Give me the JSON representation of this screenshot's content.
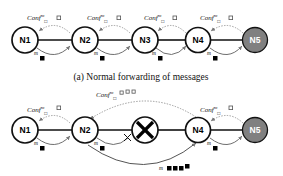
{
  "figure": {
    "panels": [
      {
        "id": "panel-a",
        "caption": "(a) Normal forwarding of messages",
        "node_cy": 40,
        "nodes": [
          {
            "label": "N1",
            "cx": 25,
            "filled": false
          },
          {
            "label": "N2",
            "cx": 85,
            "filled": false
          },
          {
            "label": "N3",
            "cx": 145,
            "filled": false
          },
          {
            "label": "N4",
            "cx": 198,
            "filled": false
          },
          {
            "label": "N5",
            "cx": 255,
            "filled": true
          }
        ],
        "conf_labels": [
          {
            "text": "Conf",
            "sup": "m",
            "sub": "□",
            "x": 40,
            "y": 18
          },
          {
            "text": "Conf",
            "sup": "m",
            "sub": "□",
            "x": 100,
            "y": 18
          },
          {
            "text": "Conf",
            "sup": "m",
            "sub": "□",
            "x": 156,
            "y": 18
          },
          {
            "text": "Conf",
            "sup": "m",
            "sub": "□",
            "x": 212,
            "y": 18
          }
        ],
        "msg_labels": [
          {
            "text": "m",
            "x": 37,
            "y": 53
          },
          {
            "text": "m",
            "x": 97,
            "y": 53
          },
          {
            "text": "m",
            "x": 155,
            "y": 53
          },
          {
            "text": "m",
            "x": 210,
            "y": 53
          }
        ]
      },
      {
        "id": "panel-b",
        "caption": "",
        "node_cy": 130,
        "nodes": [
          {
            "label": "N1",
            "cx": 25,
            "filled": false,
            "failed": false
          },
          {
            "label": "N2",
            "cx": 85,
            "filled": false,
            "failed": false
          },
          {
            "label": "",
            "cx": 145,
            "filled": false,
            "failed": true
          },
          {
            "label": "N4",
            "cx": 198,
            "filled": false,
            "failed": false
          },
          {
            "label": "N5",
            "cx": 255,
            "filled": true,
            "failed": false
          }
        ],
        "conf_labels": [
          {
            "text": "Conf",
            "sup": "m",
            "sub": "□",
            "x": 40,
            "y": 110
          },
          {
            "text": "Conf",
            "sup": "m",
            "sub": "□",
            "x": 212,
            "y": 110
          },
          {
            "text": "Conf",
            "sup": "m",
            "sub": "□",
            "x": 98,
            "y": 95
          }
        ],
        "msg_labels": [
          {
            "text": "m",
            "x": 37,
            "y": 143
          },
          {
            "text": "m",
            "x": 97,
            "y": 143
          },
          {
            "text": "m",
            "x": 210,
            "y": 143
          },
          {
            "text": "m",
            "x": 161,
            "y": 170
          }
        ]
      }
    ],
    "colors": {
      "node_fill": "#ffffff",
      "node_fill_dest": "#808080",
      "stroke": "#111111",
      "dotted": "#9a9a9a",
      "marker": "#000000"
    }
  }
}
